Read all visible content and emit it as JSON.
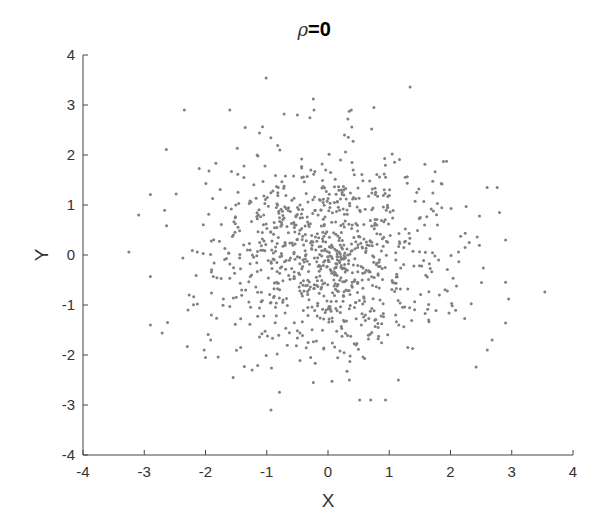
{
  "chart_data": {
    "type": "scatter",
    "title_parts": {
      "symbol": "ρ",
      "rest": "=0"
    },
    "xlabel": "X",
    "ylabel": "Y",
    "xlim": [
      -4,
      4
    ],
    "ylim": [
      -4,
      4
    ],
    "xticks": [
      -4,
      -3,
      -2,
      -1,
      0,
      1,
      2,
      3,
      4
    ],
    "yticks": [
      -4,
      -3,
      -2,
      -1,
      0,
      1,
      2,
      3,
      4
    ],
    "grid": false,
    "legend": null,
    "box": "left-bottom only",
    "marker_color": "#808080",
    "marker_size": 3,
    "series": [
      {
        "name": "samples",
        "distribution": "bivariate standard normal",
        "correlation": 0,
        "count_approx": 1000,
        "mean": [
          0,
          0
        ],
        "std": [
          1,
          1
        ],
        "seed": 20240517,
        "notable_points": [
          {
            "x": -3.25,
            "y": 0.06
          },
          {
            "x": -3.09,
            "y": 0.8
          },
          {
            "x": 3.54,
            "y": -0.74
          },
          {
            "x": -1.01,
            "y": 3.54
          },
          {
            "x": 1.34,
            "y": 3.36
          },
          {
            "x": -0.24,
            "y": 3.12
          },
          {
            "x": -0.93,
            "y": -3.1
          },
          {
            "x": -0.24,
            "y": -2.55
          },
          {
            "x": 0.75,
            "y": 2.95
          },
          {
            "x": -1.55,
            "y": -2.45
          },
          {
            "x": 2.95,
            "y": -0.88
          },
          {
            "x": 2.8,
            "y": 0.85
          },
          {
            "x": -2.62,
            "y": -1.35
          },
          {
            "x": -2.48,
            "y": 1.22
          },
          {
            "x": 2.68,
            "y": -1.7
          },
          {
            "x": 2.6,
            "y": -1.9
          },
          {
            "x": 0.35,
            "y": -2.5
          },
          {
            "x": -0.5,
            "y": 2.8
          },
          {
            "x": 0.38,
            "y": 2.9
          },
          {
            "x": -2.0,
            "y": -2.05
          }
        ]
      }
    ]
  },
  "axes": {
    "x_tick_labels": [
      "-4",
      "-3",
      "-2",
      "-1",
      "0",
      "1",
      "2",
      "3",
      "4"
    ],
    "y_tick_labels": [
      "-4",
      "-3",
      "-2",
      "-1",
      "0",
      "1",
      "2",
      "3",
      "4"
    ],
    "x_label": "X",
    "y_label": "Y"
  },
  "title": {
    "symbol": "ρ",
    "rest": "=0"
  }
}
